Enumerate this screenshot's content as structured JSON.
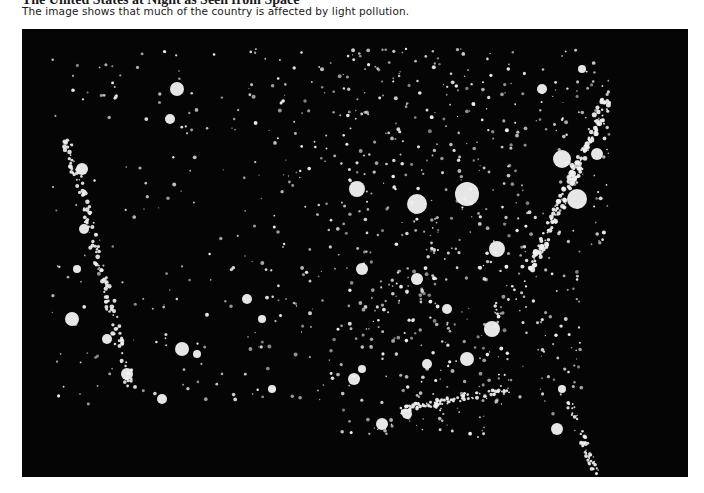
{
  "figure": {
    "title": "The United States at Night as Seen from Space",
    "caption": "The image shows that much of the country is affected by light pollution.",
    "image_subject": "satellite-night-lights-contiguous-united-states",
    "colors": {
      "background": "#050505",
      "light": "#f2f2f2"
    }
  }
}
